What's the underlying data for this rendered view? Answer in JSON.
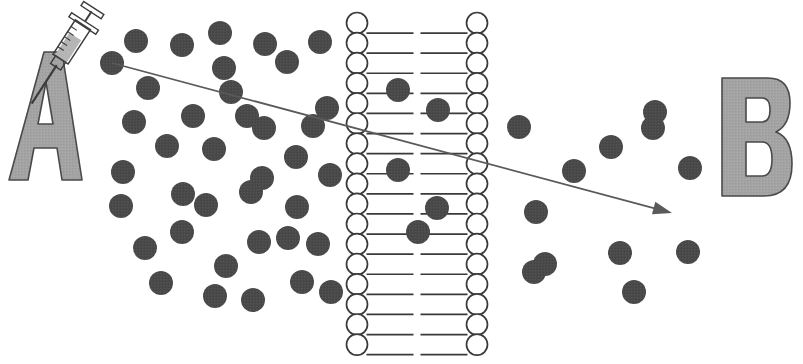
{
  "figure": {
    "background_color": "#ffffff",
    "width": 803,
    "height": 364
  },
  "colors": {
    "particle_fill": "#4a4a4a",
    "letter_fill": "#a0a0a0",
    "letter_outline": "#4a4a4a",
    "membrane_stroke": "#3a3a3a",
    "membrane_head_fill": "#ffffff",
    "arrow_stroke": "#5a5a5a",
    "syringe_barrel_fill": "#cfcfcf",
    "syringe_stroke": "#3c3c3c",
    "background": "#ffffff"
  },
  "labels": {
    "compartment_a": "A",
    "compartment_b": "B"
  },
  "compartment_a_label": {
    "text": "A",
    "x": 14,
    "y": 52,
    "width": 68,
    "height": 128
  },
  "compartment_b_label": {
    "text": "B",
    "x": 722,
    "y": 78,
    "width": 68,
    "height": 118
  },
  "syringe": {
    "name": "syringe",
    "angle_deg": 33,
    "pivot_x": 62,
    "pivot_y": 58,
    "needle_tip_x": 32,
    "needle_tip_y": 100,
    "plunger_top_x": 80,
    "plunger_top_y": 12
  },
  "arrow": {
    "name": "diffusion-arrow",
    "start_x": 112,
    "start_y": 63,
    "end_x": 672,
    "end_y": 213,
    "head_length": 19,
    "head_width": 13
  },
  "membrane": {
    "name": "lipid-bilayer",
    "left_column_center_x": 357,
    "right_column_center_x": 477,
    "head_radius": 10.5,
    "head_count_per_column": 17,
    "first_head_center_y": 23,
    "head_spacing_y": 20.1,
    "tail_length": 46,
    "tail_count_per_head": 1
  },
  "particles": {
    "radius": 12,
    "compartment_a_count": 38,
    "membrane_count": 5,
    "compartment_b_count": 12,
    "compartment_a": [
      [
        112,
        63
      ],
      [
        136,
        41
      ],
      [
        182,
        45
      ],
      [
        220,
        33
      ],
      [
        265,
        44
      ],
      [
        320,
        42
      ],
      [
        148,
        88
      ],
      [
        224,
        68
      ],
      [
        287,
        62
      ],
      [
        134,
        122
      ],
      [
        193,
        116
      ],
      [
        264,
        128
      ],
      [
        313,
        126
      ],
      [
        231,
        92
      ],
      [
        123,
        172
      ],
      [
        167,
        146
      ],
      [
        214,
        149
      ],
      [
        262,
        178
      ],
      [
        296,
        157
      ],
      [
        121,
        206
      ],
      [
        206,
        205
      ],
      [
        251,
        192
      ],
      [
        297,
        207
      ],
      [
        330,
        175
      ],
      [
        145,
        248
      ],
      [
        182,
        232
      ],
      [
        226,
        266
      ],
      [
        259,
        242
      ],
      [
        288,
        238
      ],
      [
        318,
        244
      ],
      [
        161,
        283
      ],
      [
        215,
        296
      ],
      [
        253,
        300
      ],
      [
        302,
        282
      ],
      [
        331,
        292
      ],
      [
        183,
        194
      ],
      [
        247,
        116
      ],
      [
        327,
        108
      ]
    ],
    "membrane_embedded": [
      [
        398,
        90
      ],
      [
        438,
        110
      ],
      [
        398,
        170
      ],
      [
        437,
        208
      ],
      [
        418,
        232
      ]
    ],
    "compartment_b": [
      [
        519,
        127
      ],
      [
        611,
        147
      ],
      [
        655,
        112
      ],
      [
        574,
        171
      ],
      [
        536,
        212
      ],
      [
        653,
        128
      ],
      [
        545,
        264
      ],
      [
        620,
        253
      ],
      [
        688,
        252
      ],
      [
        634,
        292
      ],
      [
        534,
        272
      ],
      [
        690,
        168
      ]
    ]
  }
}
